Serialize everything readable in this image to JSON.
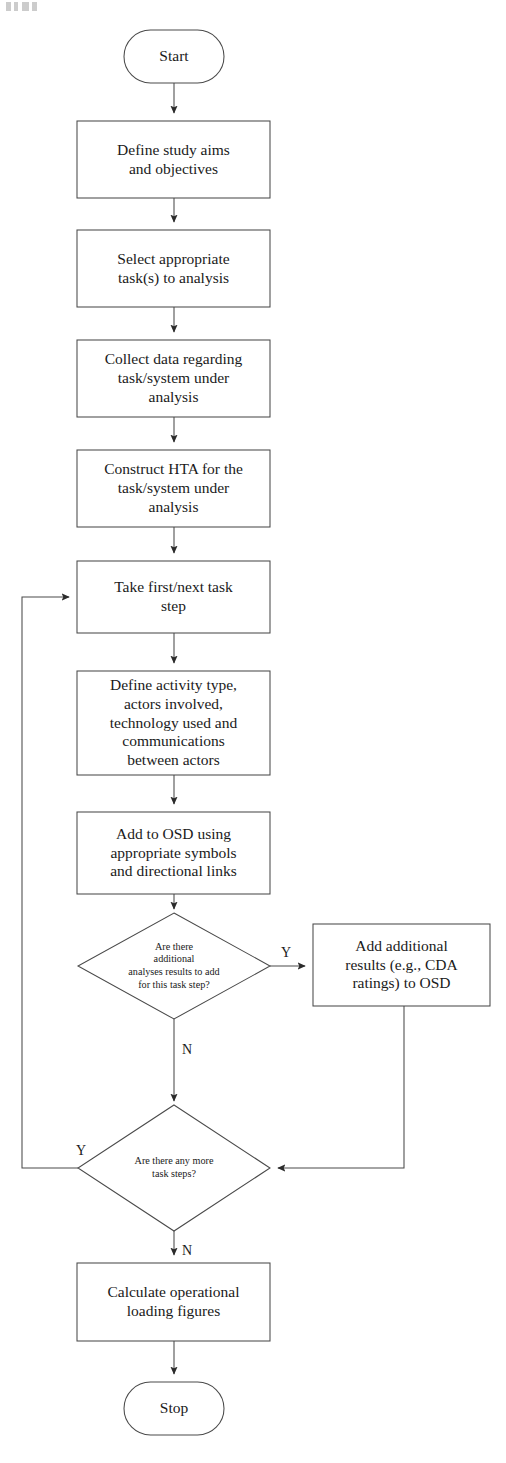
{
  "figure": {
    "type": "flowchart",
    "stroke_color": "#3c3c3c",
    "fill_color": "#ffffff",
    "text_color": "#1a1a1a",
    "background": "#ffffff"
  },
  "nodes": [
    {
      "id": "start",
      "shape": "terminator",
      "text": "Start",
      "x": 124,
      "y": 30,
      "w": 100,
      "h": 53
    },
    {
      "id": "define-aims",
      "shape": "process",
      "text": "Define study aims\nand objectives",
      "x": 77,
      "y": 121,
      "w": 193,
      "h": 77
    },
    {
      "id": "select-task",
      "shape": "process",
      "text": "Select appropriate\ntask(s) to analysis",
      "x": 77,
      "y": 230,
      "w": 193,
      "h": 77
    },
    {
      "id": "collect-data",
      "shape": "process",
      "text": "Collect data regarding\ntask/system under\nanalysis",
      "x": 77,
      "y": 340,
      "w": 193,
      "h": 77
    },
    {
      "id": "construct-hta",
      "shape": "process",
      "text": "Construct HTA for the\ntask/system under\nanalysis",
      "x": 77,
      "y": 450,
      "w": 193,
      "h": 77
    },
    {
      "id": "take-task-step",
      "shape": "process",
      "text": "Take first/next task\nstep",
      "x": 77,
      "y": 561,
      "w": 193,
      "h": 72
    },
    {
      "id": "define-activity",
      "shape": "process",
      "text": "Define activity type,\nactors involved,\ntechnology used and\ncommunications\nbetween actors",
      "x": 77,
      "y": 671,
      "w": 193,
      "h": 104
    },
    {
      "id": "add-to-osd",
      "shape": "process",
      "text": "Add to OSD using\nappropriate symbols\nand directional links",
      "x": 77,
      "y": 812,
      "w": 193,
      "h": 82
    },
    {
      "id": "decision-additional-analyses",
      "shape": "decision",
      "text": "Are there\nadditional\nanalyses results to add\nfor this task step?",
      "cx": 174,
      "cy": 966,
      "rx": 96,
      "ry": 53
    },
    {
      "id": "add-additional-results",
      "shape": "process",
      "text": "Add additional\nresults (e.g., CDA\nratings) to OSD",
      "x": 313,
      "y": 924,
      "w": 177,
      "h": 82
    },
    {
      "id": "decision-more-steps",
      "shape": "decision",
      "text": "Are there any more\ntask steps?",
      "cx": 174,
      "cy": 1168,
      "rx": 96,
      "ry": 63
    },
    {
      "id": "calculate-loading",
      "shape": "process",
      "text": "Calculate operational\nloading figures",
      "x": 77,
      "y": 1263,
      "w": 193,
      "h": 78
    },
    {
      "id": "stop",
      "shape": "terminator",
      "text": "Stop",
      "x": 124,
      "y": 1382,
      "w": 100,
      "h": 53
    }
  ],
  "edge_labels": [
    {
      "id": "yes-additional",
      "text": "Y",
      "x": 281,
      "y": 945
    },
    {
      "id": "no-additional",
      "text": "N",
      "x": 182,
      "y": 1042
    },
    {
      "id": "yes-more-steps",
      "text": "Y",
      "x": 76,
      "y": 1143
    },
    {
      "id": "no-more-steps",
      "text": "N",
      "x": 182,
      "y": 1243
    }
  ],
  "edges": [
    {
      "from": "start",
      "to": "define-aims",
      "label": ""
    },
    {
      "from": "define-aims",
      "to": "select-task",
      "label": ""
    },
    {
      "from": "select-task",
      "to": "collect-data",
      "label": ""
    },
    {
      "from": "collect-data",
      "to": "construct-hta",
      "label": ""
    },
    {
      "from": "construct-hta",
      "to": "take-task-step",
      "label": ""
    },
    {
      "from": "take-task-step",
      "to": "define-activity",
      "label": ""
    },
    {
      "from": "define-activity",
      "to": "add-to-osd",
      "label": ""
    },
    {
      "from": "add-to-osd",
      "to": "decision-additional-analyses",
      "label": ""
    },
    {
      "from": "decision-additional-analyses",
      "to": "add-additional-results",
      "label": "Y"
    },
    {
      "from": "decision-additional-analyses",
      "to": "decision-more-steps",
      "label": "N"
    },
    {
      "from": "add-additional-results",
      "to": "decision-more-steps",
      "label": ""
    },
    {
      "from": "decision-more-steps",
      "to": "take-task-step",
      "label": "Y"
    },
    {
      "from": "decision-more-steps",
      "to": "calculate-loading",
      "label": "N"
    },
    {
      "from": "calculate-loading",
      "to": "stop",
      "label": ""
    }
  ]
}
